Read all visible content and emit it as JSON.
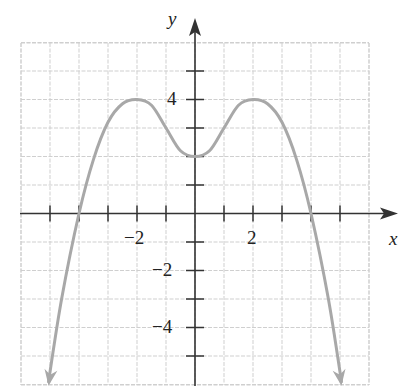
{
  "chart_data": {
    "type": "line",
    "title": "",
    "xlabel": "x",
    "ylabel": "y",
    "xlim": [
      -6,
      6
    ],
    "ylim": [
      -6,
      6
    ],
    "grid": true,
    "x_tick_labels": [
      {
        "value": -2,
        "label": "−2"
      },
      {
        "value": 2,
        "label": "2"
      }
    ],
    "y_tick_labels": [
      {
        "value": 4,
        "label": "4"
      },
      {
        "value": -2,
        "label": "−2"
      },
      {
        "value": -4,
        "label": "−4"
      }
    ],
    "series": [
      {
        "name": "f(x)",
        "color": "#a8a8a8",
        "arrows_at_ends": true,
        "x": [
          -5.05,
          -4.6,
          -4.0,
          -3.5,
          -3.0,
          -2.5,
          -2.0,
          -1.5,
          -1.0,
          -0.5,
          0.0,
          0.5,
          1.0,
          1.5,
          2.0,
          2.5,
          3.0,
          3.5,
          4.0,
          4.6,
          5.05
        ],
        "y": [
          -5.9,
          -3.0,
          0.0,
          1.9,
          3.2,
          3.85,
          4.0,
          3.8,
          3.0,
          2.2,
          2.0,
          2.2,
          3.0,
          3.8,
          4.0,
          3.85,
          3.2,
          1.9,
          0.0,
          -3.0,
          -5.9
        ]
      }
    ],
    "key_points": {
      "local_maxima": [
        [
          -2,
          4
        ],
        [
          2,
          4
        ]
      ],
      "local_minimum": [
        0,
        2
      ],
      "x_intercepts": [
        -4,
        4
      ]
    }
  },
  "labels": {
    "x_axis": "x",
    "y_axis": "y",
    "x_tick_neg2": "−2",
    "x_tick_2": "2",
    "y_tick_4": "4",
    "y_tick_neg2": "−2",
    "y_tick_neg4": "−4"
  },
  "colors": {
    "axis": "#333333",
    "grid": "#cfcfcf",
    "curve": "#a8a8a8"
  }
}
